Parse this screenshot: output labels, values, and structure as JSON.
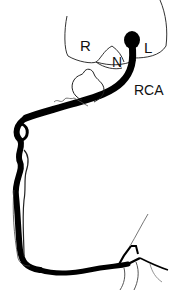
{
  "diagram": {
    "labels": {
      "right_cusp": "R",
      "noncoronary_cusp": "N",
      "left_cusp": "L",
      "artery": "RCA"
    },
    "colors": {
      "vessel": "#000000",
      "outline": "#333333",
      "background": "#ffffff"
    }
  }
}
